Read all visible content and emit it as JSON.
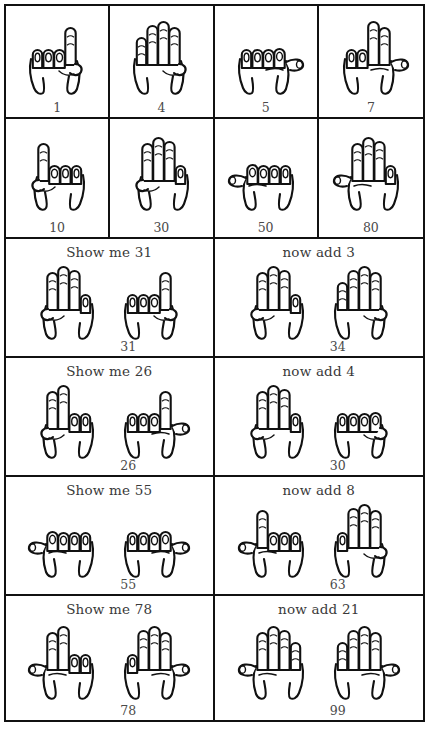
{
  "sheet": {
    "title": "Finger counting chart",
    "stroke_color": "#111111",
    "text_color": "#3a3a3a",
    "background": "#ffffff"
  },
  "rows": [
    {
      "kind": "digits",
      "cells": [
        {
          "value": "1",
          "hands": [
            {
              "sign": "one",
              "mirrored": false
            }
          ]
        },
        {
          "value": "4",
          "hands": [
            {
              "sign": "four",
              "mirrored": false
            }
          ]
        },
        {
          "value": "5",
          "hands": [
            {
              "sign": "five",
              "mirrored": false
            }
          ]
        },
        {
          "value": "7",
          "hands": [
            {
              "sign": "seven",
              "mirrored": false
            }
          ]
        }
      ]
    },
    {
      "kind": "tens",
      "cells": [
        {
          "value": "10",
          "hands": [
            {
              "sign": "one",
              "mirrored": true
            }
          ]
        },
        {
          "value": "30",
          "hands": [
            {
              "sign": "three",
              "mirrored": true
            }
          ]
        },
        {
          "value": "50",
          "hands": [
            {
              "sign": "five",
              "mirrored": true
            }
          ]
        },
        {
          "value": "80",
          "hands": [
            {
              "sign": "eight",
              "mirrored": true
            }
          ]
        }
      ]
    },
    {
      "kind": "task",
      "cells": [
        {
          "prompt": "Show me 31",
          "value": "31",
          "hands": [
            {
              "sign": "three",
              "mirrored": true
            },
            {
              "sign": "one",
              "mirrored": false
            }
          ]
        },
        {
          "prompt": "now add 3",
          "value": "34",
          "hands": [
            {
              "sign": "three",
              "mirrored": true
            },
            {
              "sign": "four",
              "mirrored": false
            }
          ]
        }
      ]
    },
    {
      "kind": "task",
      "cells": [
        {
          "prompt": "Show me 26",
          "value": "26",
          "hands": [
            {
              "sign": "two",
              "mirrored": true
            },
            {
              "sign": "six",
              "mirrored": false
            }
          ]
        },
        {
          "prompt": "now add 4",
          "value": "30",
          "hands": [
            {
              "sign": "three",
              "mirrored": true
            },
            {
              "sign": "zero",
              "mirrored": false
            }
          ]
        }
      ]
    },
    {
      "kind": "task",
      "cells": [
        {
          "prompt": "Show me 55",
          "value": "55",
          "hands": [
            {
              "sign": "five",
              "mirrored": true
            },
            {
              "sign": "five",
              "mirrored": false
            }
          ]
        },
        {
          "prompt": "now add 8",
          "value": "63",
          "hands": [
            {
              "sign": "six",
              "mirrored": true
            },
            {
              "sign": "three",
              "mirrored": false
            }
          ]
        }
      ]
    },
    {
      "kind": "task",
      "cells": [
        {
          "prompt": "Show me 78",
          "value": "78",
          "hands": [
            {
              "sign": "seven",
              "mirrored": true
            },
            {
              "sign": "eight",
              "mirrored": false
            }
          ]
        },
        {
          "prompt": "now add 21",
          "value": "99",
          "hands": [
            {
              "sign": "nine",
              "mirrored": true
            },
            {
              "sign": "nine",
              "mirrored": false
            }
          ]
        }
      ]
    }
  ]
}
